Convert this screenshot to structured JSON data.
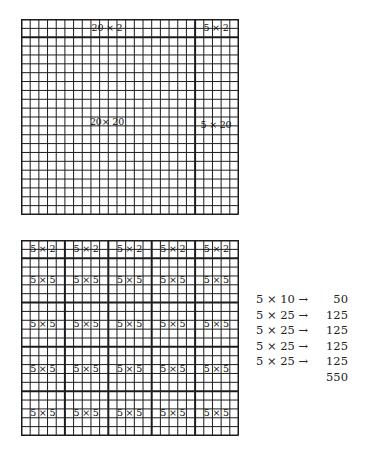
{
  "top_grid": {
    "cols": 25,
    "rows": 22,
    "thick_cols_after": [
      20
    ],
    "thick_rows_after": [
      2
    ],
    "labels": {
      "strip_top": "20 × 2",
      "strip_corner": "5 × 2",
      "main": "20× 20",
      "strip_right": "5 × 20"
    }
  },
  "bottom_grid": {
    "cols": 25,
    "rows": 22,
    "thick_cols_after": [
      5,
      10,
      15,
      20
    ],
    "thick_rows_after": [
      2,
      7,
      12,
      17
    ],
    "strip_label": "5 × 2",
    "block_label": "5 × 5"
  },
  "calculation": {
    "rows": [
      {
        "expr": "5 × 10 →",
        "value": "50"
      },
      {
        "expr": "5 × 25 →",
        "value": "125"
      },
      {
        "expr": "5 × 25 →",
        "value": "125"
      },
      {
        "expr": "5 × 25 →",
        "value": "125"
      },
      {
        "expr": "5 × 25 →",
        "value": "125"
      }
    ],
    "total": "550"
  },
  "colors": {
    "line": "#1c1c1c",
    "background": "#ffffff"
  }
}
